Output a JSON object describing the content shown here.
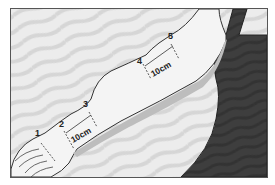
{
  "figure": {
    "points": [
      {
        "label": "1"
      },
      {
        "label": "2"
      },
      {
        "label": "3"
      },
      {
        "label": "4"
      },
      {
        "label": "5"
      }
    ],
    "segments": [
      {
        "label": "10cm",
        "between": "2-3"
      },
      {
        "label": "10cm",
        "between": "4-5"
      }
    ],
    "colors": {
      "background": "#e8e8e8",
      "arm": "#f2f2f2",
      "arm_shadow": "#bdbdbd",
      "clothing": "#3c3c3c",
      "outline": "#333333"
    }
  }
}
